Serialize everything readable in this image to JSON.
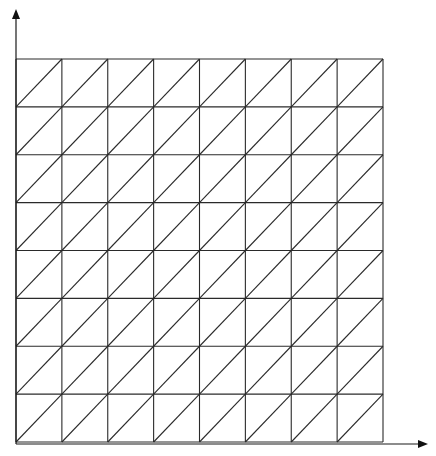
{
  "diagram": {
    "type": "structured-triangular-mesh",
    "grid": {
      "columns": 8,
      "rows": 8,
      "left": 16,
      "top": 59,
      "right": 383,
      "bottom": 442,
      "diagonal_direction": "bottom-left-to-top-right"
    },
    "axes": {
      "x_axis": {
        "from": [
          16,
          444
        ],
        "to": [
          428,
          444
        ],
        "label": ""
      },
      "y_axis": {
        "from": [
          16,
          444
        ],
        "to": [
          16,
          9
        ],
        "label": ""
      }
    },
    "colors": {
      "line": "#2a2a2a",
      "axis": "#1a1a1a",
      "background": "#ffffff"
    }
  }
}
